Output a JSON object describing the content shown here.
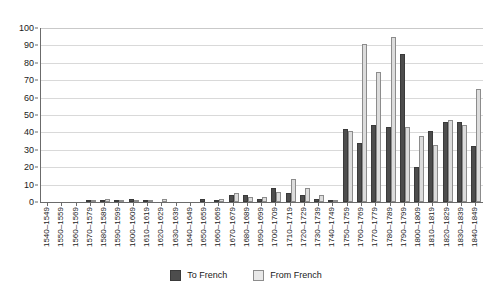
{
  "chart_data": {
    "type": "bar",
    "title": "",
    "subtitle": "",
    "xlabel": "",
    "ylabel": "",
    "ylim": [
      0,
      100
    ],
    "ytick_step": 10,
    "grid": true,
    "legend_position": "bottom-center",
    "categories": [
      "1540–1549",
      "1550–1559",
      "1560–1569",
      "1570–1579",
      "1580–1589",
      "1590–1599",
      "1600–1609",
      "1610–1619",
      "1620–1629",
      "1630–1639",
      "1640–1649",
      "1650–1659",
      "1660–1669",
      "1670–1679",
      "1680–1689",
      "1690–1699",
      "1700–1709",
      "1710–1719",
      "1720–1729",
      "1730–1739",
      "1740–1749",
      "1750–1759",
      "1760–1769",
      "1770–1779",
      "1780–1789",
      "1790–1799",
      "1800–1809",
      "1810–1819",
      "1820–1829",
      "1830–1839",
      "1840–1849"
    ],
    "yticks": [
      0,
      10,
      20,
      30,
      40,
      50,
      60,
      70,
      80,
      90,
      100
    ],
    "series": [
      {
        "name": "To French",
        "color": "#4d4d4d",
        "values": [
          0,
          0,
          0,
          1,
          1,
          1,
          2,
          1,
          0,
          0,
          0,
          2,
          1,
          4,
          4,
          2,
          8,
          5,
          4,
          2,
          1,
          42,
          34,
          44,
          43,
          85,
          20,
          41,
          46,
          46,
          32
        ]
      },
      {
        "name": "From French",
        "color": "#dcdcdc",
        "values": [
          0,
          0,
          0,
          1,
          2,
          1,
          1,
          1,
          2,
          0,
          0,
          0,
          2,
          5,
          3,
          3,
          6,
          13,
          8,
          4,
          1,
          41,
          91,
          75,
          95,
          43,
          38,
          33,
          47,
          44,
          65
        ]
      }
    ]
  },
  "legend": {
    "items": [
      {
        "label": "To French",
        "swatch": "to"
      },
      {
        "label": "From French",
        "swatch": "from"
      }
    ]
  }
}
